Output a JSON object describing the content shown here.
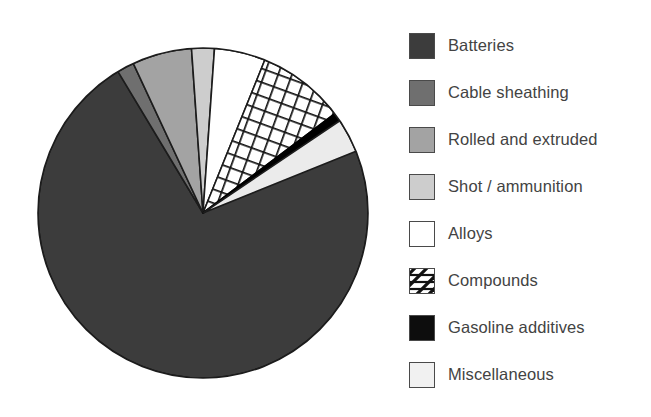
{
  "chart_data": {
    "type": "pie",
    "title": "",
    "subtitle": "",
    "xlabel": "",
    "ylabel": "",
    "legend_position": "right",
    "grid": false,
    "start_angle_deg": -37,
    "direction": "clockwise",
    "center": {
      "x": 203,
      "y": 213
    },
    "radius": 165,
    "categories": [
      "Batteries",
      "Cable sheathing",
      "Rolled and extruded",
      "Shot / ammunition",
      "Alloys",
      "Compounds",
      "Gasoline additives",
      "Miscellaneous"
    ],
    "values": [
      76.7,
      1.7,
      5.8,
      2.2,
      5.0,
      8.6,
      0.8,
      3.3
    ],
    "angles_deg": [
      276,
      6,
      21,
      8,
      18,
      31,
      3,
      12
    ],
    "slices": [
      {
        "label": "Batteries",
        "angle_deg": 276,
        "value": 76.7,
        "fill": "#3c3c3c",
        "pattern": "solid",
        "outline": "#1c1c1c"
      },
      {
        "label": "Cable sheathing",
        "angle_deg": 6,
        "value": 1.7,
        "fill": "#6f6f6f",
        "pattern": "solid",
        "outline": "#1c1c1c"
      },
      {
        "label": "Rolled and extruded",
        "angle_deg": 21,
        "value": 5.8,
        "fill": "#a3a3a3",
        "pattern": "solid",
        "outline": "#1c1c1c"
      },
      {
        "label": "Shot / ammunition",
        "angle_deg": 8,
        "value": 2.2,
        "fill": "#cdcdcd",
        "pattern": "solid",
        "outline": "#1c1c1c"
      },
      {
        "label": "Alloys",
        "angle_deg": 18,
        "value": 5.0,
        "fill": "#ffffff",
        "pattern": "solid",
        "outline": "#1c1c1c"
      },
      {
        "label": "Compounds",
        "angle_deg": 31,
        "value": 8.6,
        "fill": "#ffffff",
        "pattern": "cross-hatch",
        "outline": "#1c1c1c"
      },
      {
        "label": "Gasoline additives",
        "angle_deg": 3,
        "value": 0.8,
        "fill": "#000000",
        "pattern": "solid",
        "outline": "#000000"
      },
      {
        "label": "Miscellaneous",
        "angle_deg": 12,
        "value": 3.3,
        "fill": "#ebebeb",
        "pattern": "solid",
        "outline": "#1c1c1c"
      }
    ]
  },
  "legend": {
    "items": [
      {
        "label": "Batteries",
        "swatch": "dark-gray-swatch",
        "fill": "#3c3c3c",
        "pattern": "solid"
      },
      {
        "label": "Cable sheathing",
        "swatch": "medium-gray-swatch",
        "fill": "#6f6f6f",
        "pattern": "solid"
      },
      {
        "label": "Rolled and extruded",
        "swatch": "light-gray-swatch",
        "fill": "#a3a3a3",
        "pattern": "solid"
      },
      {
        "label": "Shot / ammunition",
        "swatch": "pale-gray-swatch",
        "fill": "#cdcdcd",
        "pattern": "solid"
      },
      {
        "label": "Alloys",
        "swatch": "white-swatch",
        "fill": "#ffffff",
        "pattern": "solid"
      },
      {
        "label": "Compounds",
        "swatch": "hatched-swatch",
        "fill": "#ffffff",
        "pattern": "diagonal-hatch"
      },
      {
        "label": "Gasoline additives",
        "swatch": "black-swatch",
        "fill": "#0d0d0d",
        "pattern": "solid"
      },
      {
        "label": "Miscellaneous",
        "swatch": "near-white-swatch",
        "fill": "#f1f1f1",
        "pattern": "solid"
      }
    ]
  },
  "colors": {
    "background": "#ffffff",
    "text": "#434343",
    "outline": "#1c1c1c"
  }
}
